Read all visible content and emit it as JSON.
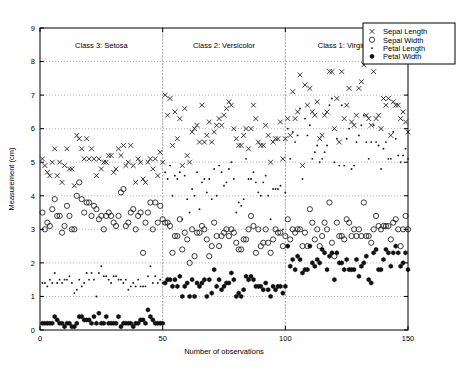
{
  "figure": {
    "title": "",
    "xlabel": "Number of observations",
    "ylabel": "Measurement (cm)"
  },
  "legend": {
    "position": "top-right",
    "items": [
      {
        "marker": "cross-marker",
        "label": "Sepal Length"
      },
      {
        "marker": "circle-marker",
        "label": "Sepal Width"
      },
      {
        "marker": "dot-marker",
        "label": "Petal Length"
      },
      {
        "marker": "star-marker",
        "label": "Petal Width"
      }
    ]
  },
  "annotations": [
    {
      "name": "class-3-setosa-label",
      "text": "Class 3: Setosa",
      "x": 25,
      "y": 8.4
    },
    {
      "name": "class-2-versicolor-label",
      "text": "Class 2: Versicolor",
      "x": 75,
      "y": 8.4
    },
    {
      "name": "class-1-virginica-label",
      "text": "Class 1: Virginica",
      "x": 125,
      "y": 8.4
    }
  ],
  "class_separators": [
    50,
    100
  ],
  "axes": {
    "xticks": [
      0,
      50,
      100,
      150
    ],
    "xticklabels": [
      "0",
      "50",
      "100",
      "150"
    ],
    "yticks": [
      0,
      1,
      2,
      3,
      4,
      5,
      6,
      7,
      8,
      9
    ],
    "yticklabels": [
      "0",
      "1",
      "2",
      "3",
      "4",
      "5",
      "6",
      "7",
      "8",
      "9"
    ],
    "xlim": [
      0,
      150
    ],
    "ylim": [
      0,
      9
    ],
    "grid": true
  },
  "chart_data": {
    "type": "scatter",
    "title": "",
    "xlabel": "Number of observations",
    "ylabel": "Measurement (cm)",
    "xlim": [
      0,
      150
    ],
    "ylim": [
      0,
      9
    ],
    "grid": true,
    "legend_position": "top-right",
    "x": [
      1,
      2,
      3,
      4,
      5,
      6,
      7,
      8,
      9,
      10,
      11,
      12,
      13,
      14,
      15,
      16,
      17,
      18,
      19,
      20,
      21,
      22,
      23,
      24,
      25,
      26,
      27,
      28,
      29,
      30,
      31,
      32,
      33,
      34,
      35,
      36,
      37,
      38,
      39,
      40,
      41,
      42,
      43,
      44,
      45,
      46,
      47,
      48,
      49,
      50,
      51,
      52,
      53,
      54,
      55,
      56,
      57,
      58,
      59,
      60,
      61,
      62,
      63,
      64,
      65,
      66,
      67,
      68,
      69,
      70,
      71,
      72,
      73,
      74,
      75,
      76,
      77,
      78,
      79,
      80,
      81,
      82,
      83,
      84,
      85,
      86,
      87,
      88,
      89,
      90,
      91,
      92,
      93,
      94,
      95,
      96,
      97,
      98,
      99,
      100,
      101,
      102,
      103,
      104,
      105,
      106,
      107,
      108,
      109,
      110,
      111,
      112,
      113,
      114,
      115,
      116,
      117,
      118,
      119,
      120,
      121,
      122,
      123,
      124,
      125,
      126,
      127,
      128,
      129,
      130,
      131,
      132,
      133,
      134,
      135,
      136,
      137,
      138,
      139,
      140,
      141,
      142,
      143,
      144,
      145,
      146,
      147,
      148,
      149,
      150
    ],
    "series": [
      {
        "name": "Sepal Length",
        "marker": "x",
        "values": [
          5.1,
          4.9,
          4.7,
          4.6,
          5.0,
          5.4,
          4.6,
          5.0,
          4.4,
          4.9,
          5.4,
          4.8,
          4.8,
          4.3,
          5.8,
          5.7,
          5.4,
          5.1,
          5.7,
          5.1,
          5.4,
          5.1,
          4.6,
          5.1,
          4.8,
          5.0,
          5.0,
          5.2,
          5.2,
          4.7,
          4.8,
          5.4,
          5.2,
          5.5,
          4.9,
          5.0,
          5.5,
          4.9,
          4.4,
          5.1,
          5.0,
          4.5,
          4.4,
          5.0,
          5.1,
          4.8,
          5.1,
          4.6,
          5.3,
          5.0,
          7.0,
          6.4,
          6.9,
          5.5,
          6.5,
          5.7,
          6.3,
          4.9,
          6.6,
          5.2,
          5.0,
          5.9,
          6.0,
          6.1,
          5.6,
          6.7,
          5.6,
          5.8,
          6.2,
          5.6,
          5.9,
          6.1,
          6.3,
          6.1,
          6.4,
          6.6,
          6.8,
          6.7,
          6.0,
          5.7,
          5.5,
          5.5,
          5.8,
          6.0,
          5.4,
          6.0,
          6.7,
          6.3,
          5.6,
          5.5,
          5.5,
          6.1,
          5.8,
          5.0,
          5.6,
          5.7,
          5.7,
          6.2,
          5.1,
          5.7,
          6.3,
          5.8,
          7.1,
          6.3,
          6.5,
          7.6,
          4.9,
          7.3,
          6.7,
          7.2,
          6.5,
          6.4,
          6.8,
          5.7,
          5.8,
          6.4,
          6.5,
          7.7,
          7.7,
          6.0,
          6.9,
          5.6,
          7.7,
          6.3,
          6.7,
          7.2,
          6.2,
          6.1,
          6.4,
          7.2,
          7.4,
          7.9,
          6.4,
          6.3,
          6.1,
          7.7,
          6.3,
          6.4,
          6.0,
          6.9,
          6.7,
          6.9,
          5.8,
          6.8,
          6.7,
          6.7,
          6.3,
          6.5,
          6.2,
          5.9
        ]
      },
      {
        "name": "Sepal Width",
        "marker": "o",
        "values": [
          3.5,
          3.0,
          3.2,
          3.1,
          3.6,
          3.9,
          3.4,
          3.4,
          2.9,
          3.1,
          3.7,
          3.4,
          3.0,
          3.0,
          4.0,
          4.4,
          3.9,
          3.5,
          3.8,
          3.8,
          3.4,
          3.7,
          3.6,
          3.3,
          3.4,
          3.0,
          3.4,
          3.5,
          3.4,
          3.2,
          3.1,
          3.4,
          4.1,
          4.2,
          3.1,
          3.2,
          3.5,
          3.6,
          3.0,
          3.4,
          3.5,
          2.3,
          3.2,
          3.5,
          3.8,
          3.0,
          3.8,
          3.2,
          3.7,
          3.3,
          3.2,
          3.2,
          3.1,
          2.3,
          2.8,
          2.8,
          3.3,
          2.4,
          2.9,
          2.7,
          2.0,
          3.0,
          2.2,
          2.9,
          2.9,
          3.1,
          3.0,
          2.7,
          2.2,
          2.5,
          3.2,
          2.8,
          2.5,
          2.8,
          2.9,
          3.0,
          2.8,
          3.0,
          2.9,
          2.6,
          2.4,
          2.4,
          2.7,
          2.7,
          3.0,
          3.4,
          3.1,
          2.3,
          3.0,
          2.5,
          2.6,
          3.0,
          2.6,
          2.3,
          2.7,
          3.0,
          2.9,
          2.9,
          2.5,
          2.8,
          3.3,
          2.7,
          3.0,
          2.9,
          3.0,
          3.0,
          2.5,
          2.9,
          2.5,
          3.6,
          3.2,
          2.7,
          3.0,
          2.5,
          2.8,
          3.2,
          3.0,
          3.8,
          2.6,
          2.2,
          3.2,
          2.8,
          2.8,
          2.7,
          3.3,
          3.2,
          2.8,
          3.0,
          2.8,
          3.0,
          2.8,
          3.8,
          2.8,
          2.8,
          2.6,
          3.0,
          3.4,
          3.1,
          3.0,
          3.1,
          3.1,
          3.1,
          2.7,
          3.2,
          3.3,
          3.0,
          2.5,
          3.0,
          3.4,
          3.0
        ]
      },
      {
        "name": "Petal Length",
        "marker": ".",
        "values": [
          1.4,
          1.4,
          1.3,
          1.5,
          1.4,
          1.7,
          1.4,
          1.5,
          1.4,
          1.5,
          1.5,
          1.6,
          1.4,
          1.1,
          1.2,
          1.5,
          1.3,
          1.4,
          1.7,
          1.5,
          1.7,
          1.5,
          1.0,
          1.7,
          1.9,
          1.6,
          1.6,
          1.5,
          1.4,
          1.6,
          1.6,
          1.5,
          1.5,
          1.4,
          1.5,
          1.2,
          1.3,
          1.4,
          1.3,
          1.5,
          1.3,
          1.3,
          1.3,
          1.6,
          1.9,
          1.4,
          1.6,
          1.4,
          1.5,
          1.4,
          4.7,
          4.5,
          4.9,
          4.0,
          4.6,
          4.5,
          4.7,
          3.3,
          4.6,
          3.9,
          3.5,
          4.2,
          4.0,
          4.7,
          3.6,
          4.4,
          4.5,
          4.1,
          4.5,
          3.9,
          4.8,
          4.0,
          4.9,
          4.7,
          4.3,
          4.4,
          4.8,
          5.0,
          4.5,
          3.5,
          3.8,
          3.7,
          3.9,
          5.1,
          4.5,
          4.5,
          4.7,
          4.4,
          4.1,
          4.0,
          4.4,
          4.6,
          4.0,
          3.3,
          4.2,
          4.2,
          4.2,
          4.3,
          3.0,
          4.1,
          6.0,
          5.1,
          5.9,
          5.6,
          5.8,
          6.6,
          4.5,
          6.3,
          5.8,
          6.1,
          5.1,
          5.3,
          5.5,
          5.0,
          5.1,
          5.3,
          5.5,
          6.7,
          6.9,
          5.0,
          5.7,
          4.9,
          6.7,
          4.9,
          5.7,
          6.0,
          4.8,
          4.9,
          5.6,
          5.8,
          6.1,
          6.4,
          5.6,
          5.1,
          5.6,
          6.1,
          5.6,
          5.5,
          4.8,
          5.4,
          5.6,
          5.1,
          5.1,
          5.9,
          5.7,
          5.2,
          5.0,
          5.2,
          5.4,
          5.1
        ]
      },
      {
        "name": "Petal Width",
        "marker": "*",
        "values": [
          0.2,
          0.2,
          0.2,
          0.2,
          0.2,
          0.4,
          0.3,
          0.2,
          0.2,
          0.1,
          0.2,
          0.2,
          0.1,
          0.1,
          0.2,
          0.4,
          0.4,
          0.3,
          0.3,
          0.3,
          0.2,
          0.4,
          0.2,
          0.5,
          0.2,
          0.2,
          0.4,
          0.2,
          0.2,
          0.2,
          0.2,
          0.4,
          0.1,
          0.2,
          0.2,
          0.2,
          0.2,
          0.1,
          0.2,
          0.2,
          0.3,
          0.3,
          0.2,
          0.6,
          0.4,
          0.3,
          0.2,
          0.2,
          0.2,
          0.2,
          1.4,
          1.5,
          1.5,
          1.3,
          1.5,
          1.3,
          1.6,
          1.0,
          1.3,
          1.4,
          1.0,
          1.5,
          1.0,
          1.4,
          1.3,
          1.4,
          1.5,
          1.0,
          1.5,
          1.1,
          1.8,
          1.3,
          1.5,
          1.2,
          1.3,
          1.4,
          1.4,
          1.7,
          1.5,
          1.0,
          1.1,
          1.0,
          1.2,
          1.6,
          1.5,
          1.6,
          1.5,
          1.3,
          1.3,
          1.3,
          1.2,
          1.4,
          1.2,
          1.0,
          1.3,
          1.2,
          1.3,
          1.3,
          1.1,
          1.3,
          2.5,
          1.9,
          2.1,
          1.8,
          2.2,
          2.1,
          1.7,
          1.8,
          1.8,
          2.5,
          2.0,
          1.9,
          2.1,
          2.0,
          2.4,
          2.3,
          1.8,
          2.2,
          2.3,
          1.5,
          2.3,
          2.0,
          2.0,
          1.8,
          2.1,
          1.8,
          1.8,
          1.8,
          2.1,
          1.6,
          1.9,
          2.0,
          2.2,
          1.5,
          1.4,
          2.3,
          2.4,
          1.8,
          1.8,
          2.1,
          2.4,
          2.3,
          1.9,
          2.3,
          2.5,
          2.3,
          1.9,
          2.0,
          2.3,
          1.8
        ]
      }
    ]
  }
}
